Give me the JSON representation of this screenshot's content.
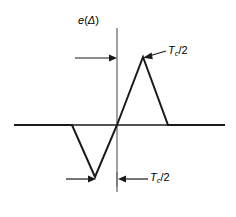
{
  "figure": {
    "type": "line",
    "background_color": "#ffffff",
    "stroke_color": "#1a1a1a",
    "y_axis_label_main": "e",
    "y_axis_label_open": "(",
    "y_axis_label_arg": "Δ",
    "y_axis_label_close": ")",
    "dimension_label_top": {
      "symbol": "T",
      "subscript": "c",
      "suffix": "/2"
    },
    "dimension_label_bottom": {
      "symbol": "T",
      "subscript": "c",
      "suffix": "/2"
    }
  },
  "chart_data": {
    "type": "line",
    "title": "",
    "xlabel": "",
    "ylabel": "e(Δ)",
    "grid": false,
    "legend": null,
    "axes": {
      "x_axis_y_px": 125,
      "x_axis_start_px": 14,
      "x_axis_end_px": 225,
      "y_axis_x_px": 117,
      "y_axis_top_px": 28,
      "y_axis_bottom_px": 192,
      "origin_px": [
        117,
        125
      ]
    },
    "series": [
      {
        "name": "e(Δ)",
        "points_px": [
          [
            14,
            125
          ],
          [
            72,
            125
          ],
          [
            95,
            177
          ],
          [
            117,
            125
          ],
          [
            143,
            57
          ],
          [
            168,
            125
          ],
          [
            225,
            125
          ]
        ],
        "description": "S-curve discriminator characteristic: flat zero, negative triangular lobe, zero crossing at origin, positive triangular lobe, flat zero"
      }
    ],
    "annotations": [
      {
        "name": "top-dimension-arrow",
        "label": "Tc/2",
        "arrow_from_px": [
          75,
          58
        ],
        "arrow_to_px": [
          117,
          58
        ],
        "direction": "right",
        "label_px": [
          168,
          50
        ],
        "leader_from_px": [
          166,
          51
        ],
        "leader_to_px": [
          145,
          59
        ]
      },
      {
        "name": "bottom-left-dimension-arrow",
        "label": "",
        "arrow_from_px": [
          68,
          179
        ],
        "arrow_to_px": [
          95,
          179
        ],
        "direction": "right"
      },
      {
        "name": "bottom-right-dimension-arrow",
        "label": "Tc/2",
        "arrow_from_px": [
          148,
          179
        ],
        "arrow_to_px": [
          118,
          179
        ],
        "direction": "left",
        "label_px": [
          150,
          177
        ]
      }
    ]
  }
}
